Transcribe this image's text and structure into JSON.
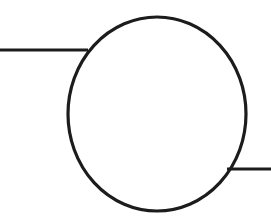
{
  "document": {
    "title": "Circle node with two connecting leads",
    "background_color": "#ffffff",
    "width": 271,
    "height": 216
  },
  "style": {
    "stroke_color": "#1c1c1c",
    "fill_color": "none",
    "circle_stroke_width": 3.2,
    "lead_stroke_width": 3.0
  },
  "diagram": {
    "type": "line-drawing",
    "caption": "",
    "shapes": {
      "circle": {
        "name": "circle-node",
        "label": "",
        "cx": 157,
        "cy": 114,
        "rx": 89,
        "ry": 97
      },
      "left_lead": {
        "name": "left-connector-line",
        "label": "",
        "x1": 0,
        "y1": 50,
        "x2": 88,
        "y2": 50
      },
      "right_lead": {
        "name": "right-connector-line",
        "label": "",
        "x1": 227,
        "y1": 169,
        "x2": 271,
        "y2": 169
      }
    }
  }
}
